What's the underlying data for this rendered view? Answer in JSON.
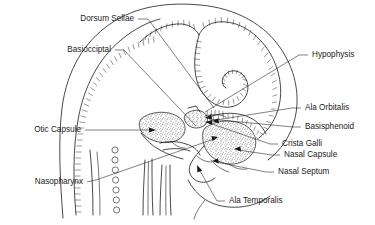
{
  "figure": {
    "background_color": "#ffffff",
    "ink_color": "#1a1a1a",
    "stipple_color": "#555555"
  },
  "labels": [
    {
      "id": "dorsum-sellae",
      "text": "Dorsum Sellae",
      "side": "left",
      "text_x": 134,
      "text_y": 19,
      "leader": "M138,19 L148,19 L214,108",
      "arrow": false
    },
    {
      "id": "basioccipital",
      "text": "Basiocciptal",
      "side": "left",
      "text_x": 111,
      "text_y": 50,
      "leader": "M115,50 L124,50 L196,126",
      "arrow": false
    },
    {
      "id": "otic-capsule",
      "text": "Otic Capsule",
      "side": "left",
      "text_x": 81,
      "text_y": 130,
      "leader": "M85,130 L152,130",
      "arrow": true,
      "arrow_x": 156,
      "arrow_y": 130,
      "arrow_angle": 0
    },
    {
      "id": "nasopharynx",
      "text": "Nasopharynx",
      "side": "left",
      "text_x": 83,
      "text_y": 182,
      "leader": "M87,182 L96,180 L214,139",
      "arrow": true,
      "arrow_x": 218,
      "arrow_y": 137,
      "arrow_angle": -19
    },
    {
      "id": "hypophysis",
      "text": "Hypophysis",
      "side": "right",
      "text_x": 312,
      "text_y": 55,
      "leader": "M308,55 L299,55 L205,112",
      "arrow": false
    },
    {
      "id": "ala-orbitalis",
      "text": "Ala Orbitalis",
      "side": "right",
      "text_x": 305,
      "text_y": 108,
      "leader": "M301,108 L292,108 L216,120",
      "arrow": true,
      "arrow_x": 212,
      "arrow_y": 121,
      "arrow_angle": 188
    },
    {
      "id": "basisphenoid",
      "text": "Basisphenoid",
      "side": "right",
      "text_x": 305,
      "text_y": 127,
      "leader": "M301,127 L293,127 L209,119",
      "arrow": true,
      "arrow_x": 205,
      "arrow_y": 118,
      "arrow_angle": 175
    },
    {
      "id": "crista-galli",
      "text": "Crista Galli",
      "side": "right",
      "text_x": 282,
      "text_y": 144,
      "leader": "M278,144 L270,144 L209,123",
      "arrow": true,
      "arrow_x": 205,
      "arrow_y": 122,
      "arrow_angle": 199
    },
    {
      "id": "nasal-capsule",
      "text": "Nasal Capsule",
      "side": "right",
      "text_x": 284,
      "text_y": 155,
      "leader": "M280,155 L272,155 L238,150",
      "arrow": true,
      "arrow_x": 234,
      "arrow_y": 149,
      "arrow_angle": 188
    },
    {
      "id": "nasal-septum",
      "text": "Nasal Septum",
      "side": "right",
      "text_x": 278,
      "text_y": 172,
      "leader": "M274,172 L266,172 L216,162",
      "arrow": true,
      "arrow_x": 212,
      "arrow_y": 161,
      "arrow_angle": 191
    },
    {
      "id": "ala-temporalis",
      "text": "Ala Temporalis",
      "side": "right",
      "text_x": 229,
      "text_y": 201,
      "leader": "M225,201 L217,201 L199,169",
      "arrow": true,
      "arrow_x": 197,
      "arrow_y": 165,
      "arrow_angle": 241
    }
  ],
  "structures": [
    {
      "id": "skull-outline",
      "name": "outer cranial outline"
    },
    {
      "id": "occipital-plate",
      "name": "occipital cartilage plate"
    },
    {
      "id": "parietal-arc",
      "name": "parietal cartilage arc"
    },
    {
      "id": "hypophysis-spiral",
      "name": "hypophyseal spiral"
    },
    {
      "id": "otic-capsule-mass",
      "name": "otic capsule cartilage"
    },
    {
      "id": "nasal-capsule-mass",
      "name": "nasal capsule cartilage"
    },
    {
      "id": "basisphenoid-mass",
      "name": "basisphenoid cartilage"
    },
    {
      "id": "notochord-column",
      "name": "notochord circle column"
    },
    {
      "id": "mandible",
      "name": "mandibular outline"
    }
  ]
}
